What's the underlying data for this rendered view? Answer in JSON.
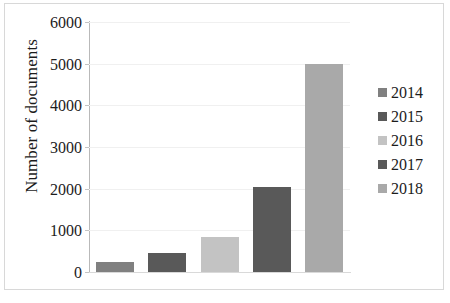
{
  "chart_data": {
    "type": "bar",
    "title": "",
    "xlabel": "",
    "ylabel": "Number of documents",
    "categories": [
      "2014",
      "2015",
      "2016",
      "2017",
      "2018"
    ],
    "values": [
      250,
      450,
      850,
      2050,
      5000
    ],
    "series": [
      {
        "name": "Number of documents",
        "values": [
          250,
          450,
          850,
          2050,
          5000
        ]
      }
    ],
    "colors": [
      "#808080",
      "#595959",
      "#c3c3c3",
      "#595959",
      "#a9a9a9"
    ],
    "ylim": [
      0,
      6000
    ],
    "yticks": [
      0,
      1000,
      2000,
      3000,
      4000,
      5000,
      6000
    ],
    "ytick_labels": [
      "0",
      "1000",
      "2000",
      "3000",
      "4000",
      "5000",
      "6000"
    ],
    "grid": true,
    "grid_axis": "y",
    "legend": {
      "position": "right",
      "entries": [
        {
          "label": "2014",
          "color": "#808080"
        },
        {
          "label": "2015",
          "color": "#595959"
        },
        {
          "label": "2016",
          "color": "#c3c3c3"
        },
        {
          "label": "2017",
          "color": "#595959"
        },
        {
          "label": "2018",
          "color": "#a9a9a9"
        }
      ]
    }
  },
  "figure": {
    "border_color": "#d8d8d8",
    "background": "#ffffff",
    "axis_color": "#b9b9b9",
    "gridline_color": "#f0f0f0",
    "text_color": "#1c1c1c"
  }
}
